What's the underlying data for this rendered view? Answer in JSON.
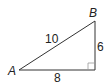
{
  "diagram": {
    "type": "right-triangle",
    "vertices": {
      "A": {
        "label": "A"
      },
      "B": {
        "label": "B"
      }
    },
    "sides": {
      "hypotenuse": {
        "label": "10"
      },
      "vertical": {
        "label": "6"
      },
      "horizontal": {
        "label": "8"
      }
    },
    "right_angle_marker": true,
    "colors": {
      "stroke": "#333333",
      "marker": "#999999"
    }
  }
}
